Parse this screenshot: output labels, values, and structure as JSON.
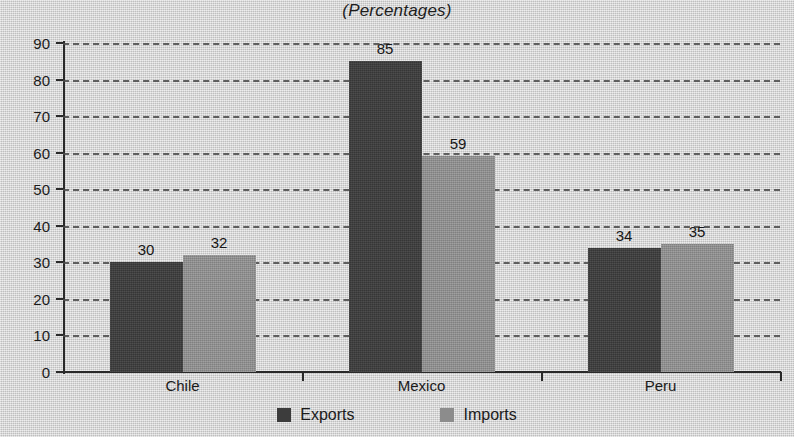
{
  "chart_data": {
    "type": "bar",
    "title": "(Percentages)",
    "xlabel": "",
    "ylabel": "",
    "ylim": [
      0,
      90
    ],
    "yticks": [
      0,
      10,
      20,
      30,
      40,
      50,
      60,
      70,
      80,
      90
    ],
    "grid": true,
    "legend_position": "bottom",
    "categories": [
      "Chile",
      "Mexico",
      "Peru"
    ],
    "series": [
      {
        "name": "Exports",
        "color": "#3c3c3c",
        "values": [
          30,
          85,
          34
        ]
      },
      {
        "name": "Imports",
        "color": "#8c8c8c",
        "values": [
          32,
          59,
          35
        ]
      }
    ]
  },
  "legend": {
    "items": [
      {
        "label": "Exports",
        "swatch": "exports-swatch"
      },
      {
        "label": "Imports",
        "swatch": "imports-swatch"
      }
    ]
  }
}
